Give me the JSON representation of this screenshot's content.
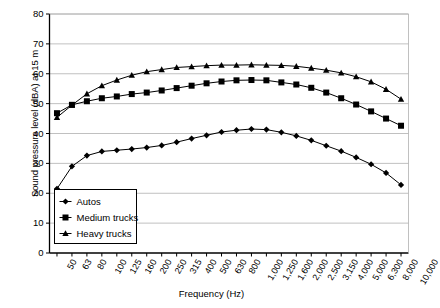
{
  "chart_data": {
    "type": "line",
    "title": "",
    "xlabel": "Frequency (Hz)",
    "ylabel": "Sound pressure level (dBA) at 15 m",
    "categories": [
      "50",
      "63",
      "80",
      "100",
      "125",
      "160",
      "200",
      "250",
      "315",
      "400",
      "500",
      "630",
      "800",
      "1,000",
      "1,250",
      "1,600",
      "2,000",
      "2,500",
      "3,150",
      "4,000",
      "5,000",
      "6,300",
      "8,000",
      "10,000"
    ],
    "ylim": [
      0,
      80
    ],
    "yticks": [
      0,
      10,
      20,
      30,
      40,
      50,
      60,
      70,
      80
    ],
    "grid": "horizontal",
    "legend_position": "inside-bottom-left",
    "series": [
      {
        "name": "Autos",
        "marker": "diamond",
        "values": [
          21.5,
          29.0,
          32.6,
          34.0,
          34.4,
          34.8,
          35.3,
          36.0,
          37.1,
          38.3,
          39.4,
          40.5,
          41.1,
          41.5,
          41.3,
          40.4,
          39.2,
          37.7,
          35.9,
          34.1,
          32.0,
          29.7,
          26.8,
          22.8
        ]
      },
      {
        "name": "Medium trucks",
        "marker": "square",
        "values": [
          46.8,
          49.6,
          50.8,
          51.8,
          52.4,
          53.2,
          53.7,
          54.4,
          55.2,
          56.0,
          56.8,
          57.4,
          57.8,
          57.9,
          57.8,
          57.1,
          56.4,
          55.3,
          53.7,
          51.8,
          49.7,
          47.4,
          45.0,
          42.6
        ]
      },
      {
        "name": "Heavy trucks",
        "marker": "triangle",
        "values": [
          45.4,
          49.5,
          53.3,
          56.0,
          57.9,
          59.5,
          60.7,
          61.4,
          62.1,
          62.4,
          62.7,
          62.9,
          62.9,
          63.0,
          62.9,
          62.8,
          62.5,
          61.9,
          61.2,
          60.3,
          59.0,
          57.3,
          54.8,
          51.5
        ]
      }
    ]
  },
  "legend": {
    "items": [
      {
        "label": "Autos"
      },
      {
        "label": "Medium trucks"
      },
      {
        "label": "Heavy trucks"
      }
    ]
  },
  "colors": {
    "series": "#000000",
    "grid": "#b0b0b0",
    "axis": "#000000",
    "background": "#ffffff"
  }
}
